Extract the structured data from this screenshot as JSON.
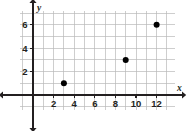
{
  "chart_data": {
    "type": "scatter",
    "title": "",
    "subtitle": "",
    "xlabel": "x",
    "ylabel": "y",
    "points": [
      {
        "x": 3,
        "y": 1
      },
      {
        "x": 9,
        "y": 3
      },
      {
        "x": 12,
        "y": 6
      }
    ],
    "x": [
      3,
      9,
      12
    ],
    "values": [
      1,
      3,
      6
    ],
    "xlim": [
      -1.4,
      13.8
    ],
    "ylim": [
      -1.6,
      7.5
    ],
    "x_ticks": [
      2,
      4,
      6,
      8,
      10,
      12
    ],
    "x_tick_labels": [
      "2",
      "4",
      "6",
      "8",
      "10",
      "12"
    ],
    "y_ticks": [
      2,
      4,
      6
    ],
    "y_tick_labels": [
      "2",
      "4",
      "6"
    ],
    "x_gridlines": [
      -1,
      0,
      1,
      2,
      3,
      4,
      5,
      6,
      7,
      8,
      9,
      10,
      11,
      12,
      13
    ],
    "y_gridlines": [
      -1,
      0,
      1,
      2,
      3,
      4,
      5,
      6,
      7
    ],
    "grid": true,
    "legend": null,
    "legend_position": "none",
    "annotations": [],
    "axis_arrows": [
      "left",
      "right",
      "up",
      "down"
    ],
    "colors": {
      "point": "#000000",
      "grid": "#b9b9b9",
      "axis": "#231f20",
      "background": "#ffffff",
      "label": "#231f20"
    }
  },
  "geometry": {
    "origin_x": 33.0,
    "origin_y": 95.0,
    "unit_x": 10.3,
    "unit_y": 11.7,
    "point_radius": 3.0,
    "grid_left": 20.0,
    "grid_right": 175.0,
    "grid_top": 11.0,
    "grid_bottom": 110.0,
    "axis_x_start": 3.0,
    "axis_x_end": 182.0,
    "axis_y_start": 3.0,
    "axis_y_end": 128.0,
    "arrow_size": 4.2,
    "tick_len": 3.0
  },
  "labels": {
    "x_axis_name": "x",
    "y_axis_name": "y",
    "x_axis_name_pos": {
      "x": 177,
      "y": 91
    },
    "y_axis_name_pos": {
      "x": 37,
      "y": 11
    }
  }
}
